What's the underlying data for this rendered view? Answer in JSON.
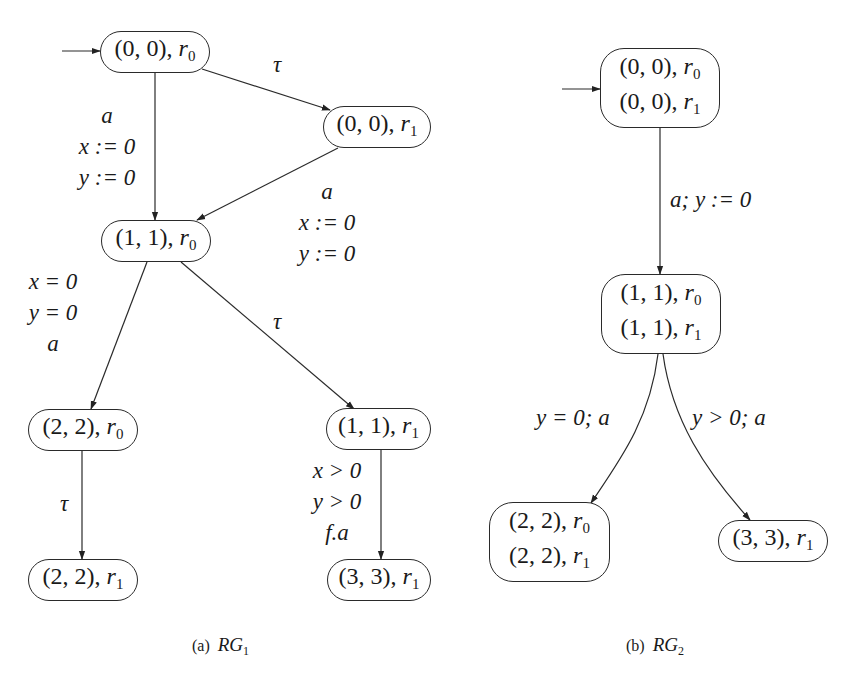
{
  "figure": {
    "graphs": [
      {
        "id": "rg1",
        "caption": {
          "prefix": "(a)",
          "name": "RG",
          "subscript": "1"
        },
        "initial_state": "n00r0",
        "nodes": [
          {
            "id": "n00r0",
            "lines": [
              {
                "tuple": "(0, 0), ",
                "reg": "r",
                "sub": "0"
              }
            ]
          },
          {
            "id": "n00r1",
            "lines": [
              {
                "tuple": "(0, 0), ",
                "reg": "r",
                "sub": "1"
              }
            ]
          },
          {
            "id": "n11r0",
            "lines": [
              {
                "tuple": "(1, 1), ",
                "reg": "r",
                "sub": "0"
              }
            ]
          },
          {
            "id": "n22r0",
            "lines": [
              {
                "tuple": "(2, 2), ",
                "reg": "r",
                "sub": "0"
              }
            ]
          },
          {
            "id": "n11r1",
            "lines": [
              {
                "tuple": "(1, 1), ",
                "reg": "r",
                "sub": "1"
              }
            ]
          },
          {
            "id": "n22r1",
            "lines": [
              {
                "tuple": "(2, 2), ",
                "reg": "r",
                "sub": "1"
              }
            ]
          },
          {
            "id": "n33r1",
            "lines": [
              {
                "tuple": "(3, 3), ",
                "reg": "r",
                "sub": "1"
              }
            ]
          }
        ],
        "edges": [
          {
            "from": "n00r0",
            "to": "n00r1",
            "label": [
              "τ"
            ]
          },
          {
            "from": "n00r0",
            "to": "n11r0",
            "label": [
              "a",
              "x := 0",
              "y := 0"
            ]
          },
          {
            "from": "n00r1",
            "to": "n11r0",
            "label": [
              "a",
              "x := 0",
              "y := 0"
            ]
          },
          {
            "from": "n11r0",
            "to": "n22r0",
            "label": [
              "x = 0",
              "y = 0",
              "a"
            ]
          },
          {
            "from": "n11r0",
            "to": "n11r1",
            "label": [
              "τ"
            ]
          },
          {
            "from": "n22r0",
            "to": "n22r1",
            "label": [
              "τ"
            ]
          },
          {
            "from": "n11r1",
            "to": "n33r1",
            "label": [
              "x > 0",
              "y > 0",
              "f.a"
            ]
          }
        ]
      },
      {
        "id": "rg2",
        "caption": {
          "prefix": "(b)",
          "name": "RG",
          "subscript": "2"
        },
        "initial_state": "m00",
        "nodes": [
          {
            "id": "m00",
            "lines": [
              {
                "tuple": "(0, 0), ",
                "reg": "r",
                "sub": "0"
              },
              {
                "tuple": "(0, 0), ",
                "reg": "r",
                "sub": "1"
              }
            ]
          },
          {
            "id": "m11",
            "lines": [
              {
                "tuple": "(1, 1), ",
                "reg": "r",
                "sub": "0"
              },
              {
                "tuple": "(1, 1), ",
                "reg": "r",
                "sub": "1"
              }
            ]
          },
          {
            "id": "m22",
            "lines": [
              {
                "tuple": "(2, 2), ",
                "reg": "r",
                "sub": "0"
              },
              {
                "tuple": "(2, 2), ",
                "reg": "r",
                "sub": "1"
              }
            ]
          },
          {
            "id": "m33",
            "lines": [
              {
                "tuple": "(3, 3), ",
                "reg": "r",
                "sub": "1"
              }
            ]
          }
        ],
        "edges": [
          {
            "from": "m00",
            "to": "m11",
            "label": [
              "a; y := 0"
            ]
          },
          {
            "from": "m11",
            "to": "m22",
            "label": [
              "y = 0; a"
            ]
          },
          {
            "from": "m11",
            "to": "m33",
            "label": [
              "y > 0; a"
            ]
          }
        ]
      }
    ]
  }
}
